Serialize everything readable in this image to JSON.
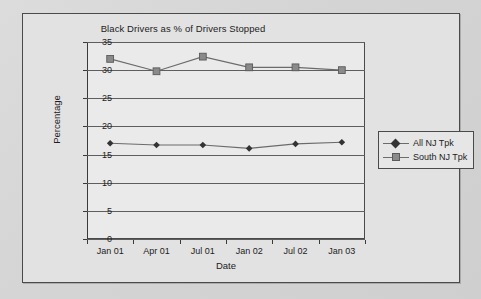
{
  "chart_data": {
    "type": "line",
    "title": "Black Drivers as % of Drivers Stopped",
    "xlabel": "Date",
    "ylabel": "Percentage",
    "categories": [
      "Jan 01",
      "Apr 01",
      "Jul 01",
      "Jan 02",
      "Jul 02",
      "Jan 03"
    ],
    "ylim": [
      0,
      35
    ],
    "yticks": [
      0,
      5,
      10,
      15,
      20,
      25,
      30,
      35
    ],
    "grid": true,
    "legend_position": "right",
    "series": [
      {
        "name": "All NJ Tpk",
        "marker": "diamond",
        "color": "#333333",
        "line_color": "#6b6b6b",
        "values": [
          17.0,
          16.7,
          16.7,
          16.1,
          16.9,
          17.2
        ]
      },
      {
        "name": "South NJ Tpk",
        "marker": "square",
        "color": "#8a8a8a",
        "line_color": "#6b6b6b",
        "values": [
          32.0,
          29.8,
          32.4,
          30.5,
          30.5,
          30.0
        ]
      }
    ]
  },
  "colors": {
    "page_background": "#d6d6d6",
    "frame_background": "#e2e2e2",
    "plot_background": "#eaeaea",
    "axis": "#3a3a3a",
    "grid": "#5e5e5e"
  }
}
